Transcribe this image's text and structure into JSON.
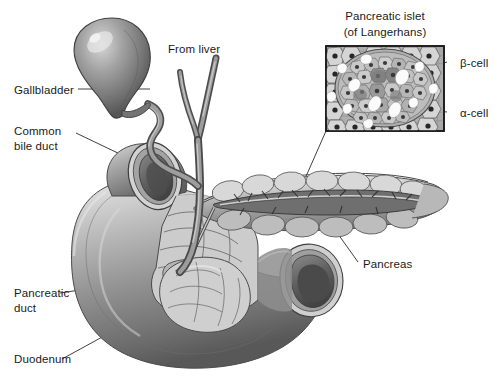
{
  "figure": {
    "kind": "anatomical-illustration",
    "background_color": "#ffffff",
    "text_color": "#1a1a1a",
    "line_color": "#2b2b2b"
  },
  "inset": {
    "title_line1": "Pancreatic islet",
    "title_line2": "(of Langerhans)",
    "border_color": "#1a1a1a",
    "labels": {
      "beta": "β-cell",
      "alpha": "α-cell"
    }
  },
  "labels": {
    "gallbladder": "Gallbladder",
    "common_bile_duct_line1": "Common",
    "common_bile_duct_line2": "bile duct",
    "from_liver": "From liver",
    "pancreas": "Pancreas",
    "pancreatic_duct_line1": "Pancreatic",
    "pancreatic_duct_line2": "duct",
    "duodenum": "Duodenum"
  },
  "palette": {
    "duct_dark": "#5d5d5d",
    "duct_mid": "#8a8a8a",
    "duct_light": "#b9b9b9",
    "organ_dark": "#6a6a6a",
    "organ_mid": "#9a9a9a",
    "organ_light": "#cfcfcf",
    "organ_highlight": "#eaeaea",
    "islet_bg": "#b6b6b6",
    "islet_core": "#8f8f8f",
    "nucleus": "#2e2e2e"
  }
}
